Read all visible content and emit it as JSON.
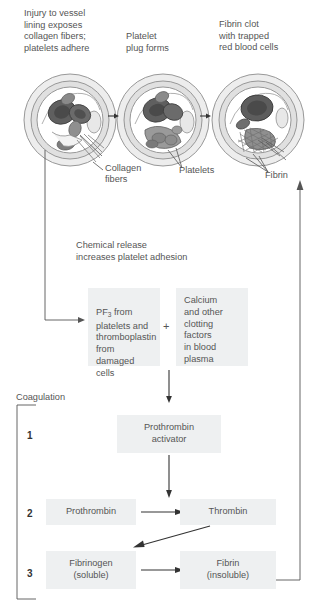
{
  "diagram": {
    "colors": {
      "box_fill": "#eef0f1",
      "text": "#555555",
      "line": "#555555",
      "vessel_outer": "#e3e3e3",
      "vessel_mid": "#d3d3d3",
      "vessel_inner": "#ffffff",
      "cell_dark": "#6a6a6a",
      "cell_mid": "#9a9a9a"
    }
  },
  "stage_captions": [
    {
      "id": "stage-1",
      "text": "Injury to vessel\nlining exposes\ncollagen fibers;\nplatelets adhere"
    },
    {
      "id": "stage-2",
      "text": "Platelet\nplug forms"
    },
    {
      "id": "stage-3",
      "text": "Fibrin clot\nwith trapped\nred blood cells"
    }
  ],
  "vessel_labels": [
    {
      "id": "collagen-fibers",
      "text": "Collagen\nfibers"
    },
    {
      "id": "platelets",
      "text": "Platelets"
    },
    {
      "id": "fibrin",
      "text": "Fibrin"
    }
  ],
  "chemical_release": {
    "text": "Chemical release\nincreases platelet adhesion"
  },
  "reactant_boxes": {
    "left": "PF3 from\nplatelets and\nthromboplastin\nfrom damaged\ncells",
    "left_prefix": "PF",
    "left_subscript": "3",
    "left_rest": " from\nplatelets and\nthromboplastin\nfrom damaged\ncells",
    "operator": "+",
    "right": "Calcium\nand other\nclotting\nfactors\nin blood\nplasma"
  },
  "coagulation": {
    "bracket_label": "Coagulation",
    "steps": [
      {
        "number": "1",
        "boxes": [
          {
            "id": "prothrombin-activator",
            "label": "Prothrombin\nactivator"
          }
        ]
      },
      {
        "number": "2",
        "boxes": [
          {
            "id": "prothrombin",
            "label": "Prothrombin"
          },
          {
            "id": "thrombin",
            "label": "Thrombin"
          }
        ]
      },
      {
        "number": "3",
        "boxes": [
          {
            "id": "fibrinogen",
            "label": "Fibrinogen\n(soluble)"
          },
          {
            "id": "fibrin-product",
            "label": "Fibrin\n(insoluble)"
          }
        ]
      }
    ]
  }
}
